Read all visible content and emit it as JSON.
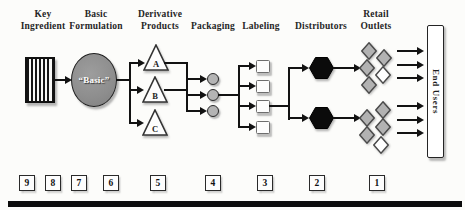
{
  "stages": [
    {
      "id": "key-ingredient",
      "label": "Key\nIngredient"
    },
    {
      "id": "basic-formulation",
      "label": "Basic\nFormulation"
    },
    {
      "id": "derivative-products",
      "label": "Derivative\nProducts"
    },
    {
      "id": "packaging",
      "label": "Packaging"
    },
    {
      "id": "labeling",
      "label": "Labeling"
    },
    {
      "id": "distributors",
      "label": "Distributors"
    },
    {
      "id": "retail-outlets",
      "label": "Retail\nOutlets"
    },
    {
      "id": "end-users",
      "label": "End Users"
    }
  ],
  "basic_node": {
    "label": "“Basic”"
  },
  "triangles": [
    "A",
    "B",
    "C"
  ],
  "sequence": [
    "9",
    "8",
    "7",
    "6",
    "5",
    "4",
    "3",
    "2",
    "1"
  ],
  "shape_counts": {
    "packaging_circles": 3,
    "labeling_squares": 4,
    "distributor_hexagons": 2,
    "retail_diamonds_per_cluster": 5
  },
  "colors": {
    "line_black": "#121212",
    "ellipse_gray": "#8d8d8d",
    "circle_gray": "#b4b4b4",
    "diamond_gray": "#b2b2b2",
    "diamond_white": "#ffffff",
    "hexagon_black": "#0b0b0b",
    "background": "#fcfcfa"
  }
}
